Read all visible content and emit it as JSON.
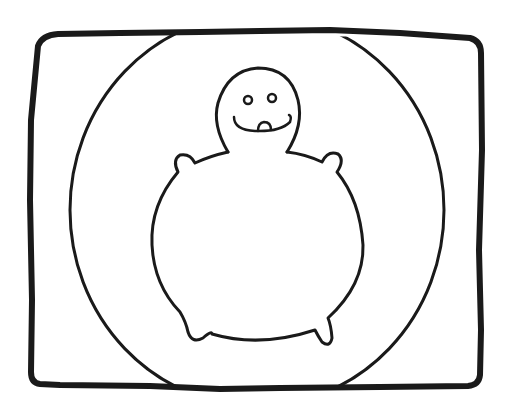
{
  "drawing": {
    "title": "Hand-drawn snowman-like figure inside circle inside frame",
    "stroke_color": "#1a1a1a",
    "background_color": "#ffffff",
    "elements": [
      "rough-rectangular-frame",
      "large-circle",
      "round-head",
      "eyes",
      "smile",
      "tongue",
      "round-body-with-four-nubs"
    ]
  }
}
